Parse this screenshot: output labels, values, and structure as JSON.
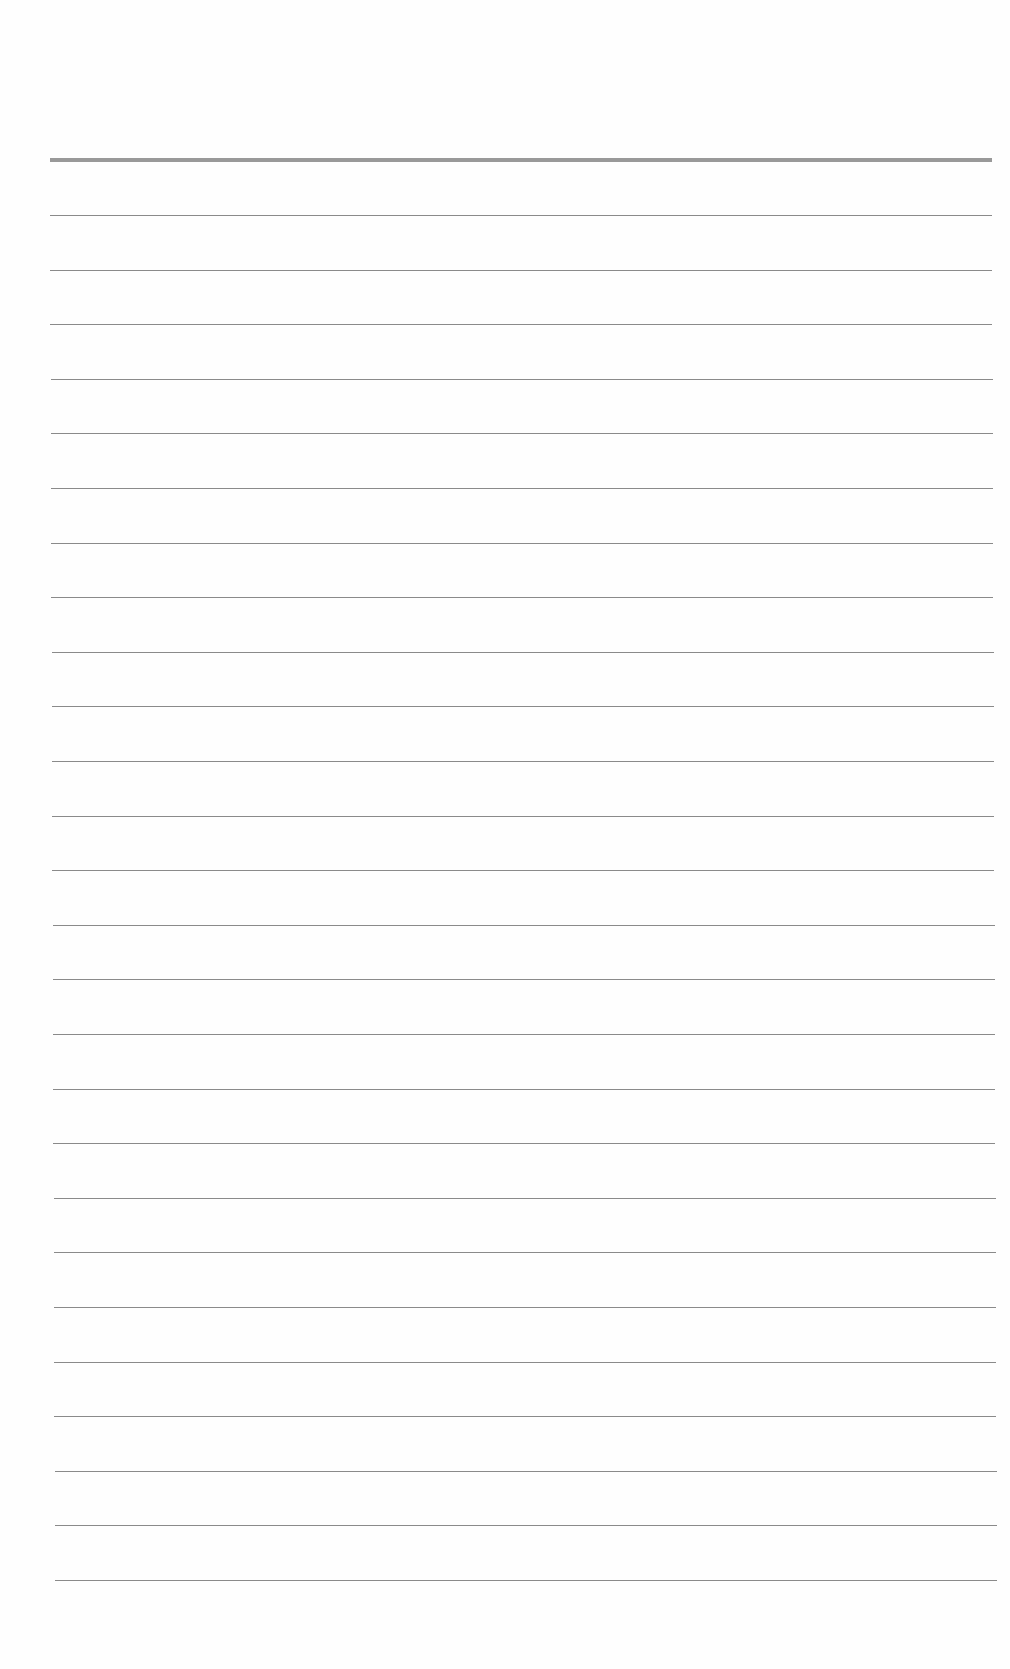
{
  "document": {
    "type": "lined-paper",
    "colors": {
      "paper": "#fefefe",
      "header_rule": "#999999",
      "line_rule": "#8a8a8a"
    },
    "header_rule": {
      "top": 158,
      "thickness": 4
    },
    "lines": {
      "count": 26,
      "first_top": 215,
      "spacing": 54.6
    }
  }
}
